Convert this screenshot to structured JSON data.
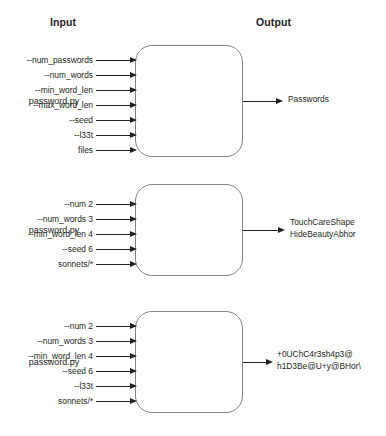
{
  "headers": {
    "input": "Input",
    "output": "Output"
  },
  "stages": [
    {
      "process_label": "password.py",
      "inputs": [
        "--num_passwords",
        "--num_words",
        "--min_word_len",
        "--max_word_len",
        "--seed",
        "--l33t",
        "files"
      ],
      "output_lines": [
        "Passwords"
      ]
    },
    {
      "process_label": "password.py",
      "inputs": [
        "--num 2",
        "--num_words 3",
        "--min_word_len 4",
        "--seed 6",
        "sonnets/*"
      ],
      "output_lines": [
        "TouchCareShape",
        "HideBeautyAbhor"
      ]
    },
    {
      "process_label": "password.py",
      "inputs": [
        "--num 2",
        "--num_words 3",
        "--min_word_len 4",
        "--seed 6",
        "--l33t",
        "sonnets/*"
      ],
      "output_lines": [
        "+0UChC4r3sh4p3@",
        "h1D3Be@U+y@BHor\\"
      ]
    }
  ],
  "colors": {
    "text": "#231f20",
    "box_border": "#808285",
    "background": "#ffffff"
  }
}
